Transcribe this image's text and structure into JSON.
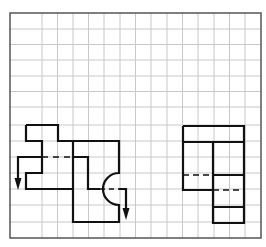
{
  "diagram": {
    "type": "orthographic-projection-on-grid",
    "frame": {
      "x1": 10,
      "y1": 13,
      "x2": 261,
      "y2": 238,
      "color": "#555555"
    },
    "grid": {
      "color": "#c8c8c8",
      "vertical_lines": [
        42,
        57.5,
        73,
        88.5,
        104,
        120,
        135.5,
        151,
        167,
        182.5,
        198,
        214,
        229.5,
        245
      ],
      "horizontal_lines": [
        29,
        44.5,
        60,
        76,
        91.5,
        107,
        125,
        141,
        157,
        173,
        189,
        205,
        222
      ]
    },
    "stroke_color": "#111111",
    "front_view": {
      "name": "front-view-with-section-cut",
      "outline_left_piece": "M26,125 L58,125 L58,141 L73,141 M26,125 L26,141 L42,141 L42,173 L26,173 L26,189 L73,189",
      "outline_right_piece": "M73,141 L119,141 L119,173 A16,16 0 0 0 119,205 L119,222 L73,222 L73,141",
      "inner_step": "M73,157 L88,157 L88,189 L100,189",
      "cut_line_left": {
        "solid": "M42,157 L18,157 L18,180",
        "dashed": "M42,157 L73,157",
        "arrow_tip": [
          18,
          190
        ]
      },
      "cut_line_right": {
        "dashed": "M100,189 L119,189",
        "solid": "M119,189 L126,189 L126,210",
        "arrow_tip": [
          126,
          220
        ]
      }
    },
    "side_view": {
      "name": "side-view",
      "solid": "M183,126 L244,126 L244,223 L213,223 L213,190 L183,190 L183,126 M183,142 L244,142 M213,142 L213,223 M213,175 L244,175 M213,207 L244,207",
      "dashed": "M183,175 L213,175 M213,190 L244,190"
    }
  }
}
